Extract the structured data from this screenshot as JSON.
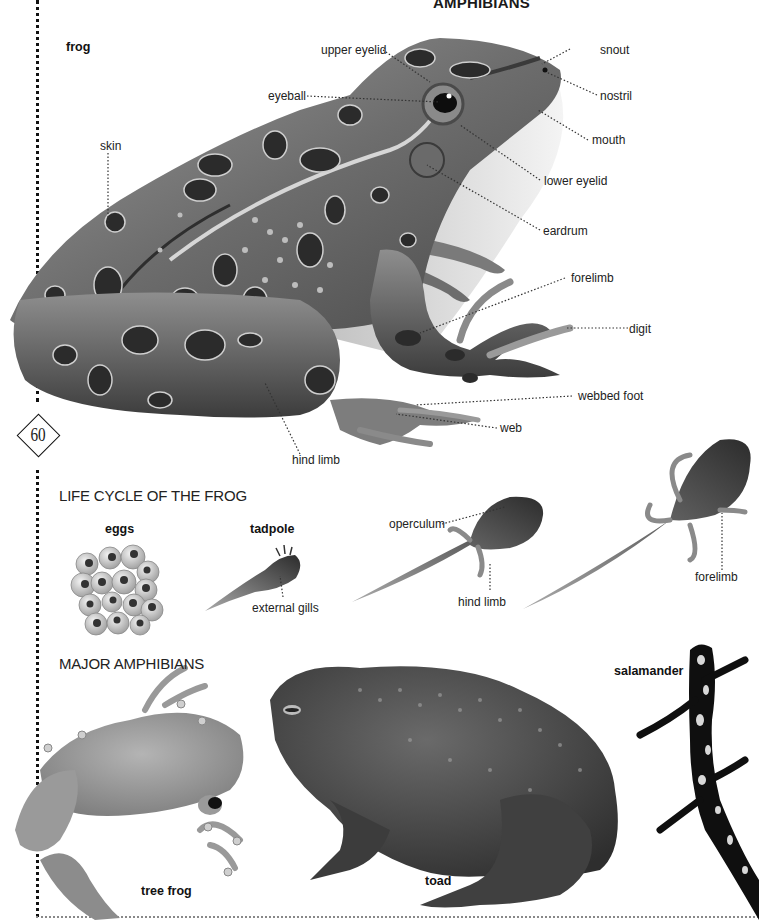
{
  "page": {
    "title": "AMPHIBIANS",
    "page_number": "60"
  },
  "frog": {
    "caption": "frog",
    "labels": {
      "upper_eyelid": "upper eyelid",
      "snout": "snout",
      "eyeball": "eyeball",
      "nostril": "nostril",
      "skin": "skin",
      "mouth": "mouth",
      "lower_eyelid": "lower eyelid",
      "eardrum": "eardrum",
      "forelimb": "forelimb",
      "digit": "digit",
      "webbed_foot": "webbed foot",
      "web": "web",
      "hind_limb": "hind limb"
    }
  },
  "life_cycle": {
    "heading": "LIFE CYCLE OF THE FROG",
    "stages": {
      "eggs": "eggs",
      "tadpole": "tadpole"
    },
    "labels": {
      "external_gills": "external gills",
      "operculum": "operculum",
      "hind_limb": "hind limb",
      "forelimb": "forelimb"
    }
  },
  "major_amphibians": {
    "heading": "MAJOR AMPHIBIANS",
    "species": {
      "tree_frog": "tree frog",
      "toad": "toad",
      "salamander": "salamander"
    }
  }
}
